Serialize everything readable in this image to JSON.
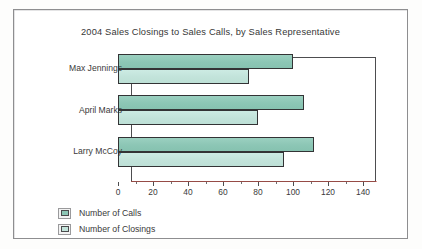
{
  "figure": {
    "title": "2004 Sales Closings to Sales Calls, by Sales Representative"
  },
  "legend": {
    "items": [
      {
        "label": "Number of Calls",
        "swatch": "calls",
        "color": "#8cc6b5"
      },
      {
        "label": "Number of Closings",
        "swatch": "closings",
        "color": "#c2e3da"
      }
    ]
  },
  "axis": {
    "tick_labels": [
      "0",
      "20",
      "40",
      "60",
      "80",
      "100",
      "120",
      "140"
    ],
    "minor_ticks": [
      10,
      30,
      50,
      70,
      90,
      110,
      130
    ]
  },
  "categories": [
    "Max Jennings",
    "April Marks",
    "Larry McCoy"
  ],
  "chart_data": {
    "type": "bar",
    "orientation": "horizontal",
    "title": "2004 Sales Closings to Sales Calls, by Sales Representative",
    "xlabel": "",
    "ylabel": "",
    "categories": [
      "Max Jennings",
      "April Marks",
      "Larry McCoy"
    ],
    "series": [
      {
        "name": "Number of Calls",
        "color": "#8cc6b5",
        "values": [
          100,
          106,
          112
        ]
      },
      {
        "name": "Number of Closings",
        "color": "#c2e3da",
        "values": [
          75,
          80,
          95
        ]
      }
    ],
    "xlim": [
      0,
      140
    ],
    "xticks": [
      0,
      20,
      40,
      60,
      80,
      100,
      120,
      140
    ],
    "xminorticks": [
      10,
      30,
      50,
      70,
      90,
      110,
      130
    ],
    "grid": false,
    "legend_position": "below-left"
  }
}
